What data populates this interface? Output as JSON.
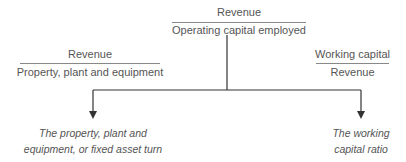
{
  "top_ratio": {
    "numerator": "Revenue",
    "denominator": "Operating capital employed"
  },
  "left_ratio": {
    "numerator": "Revenue",
    "denominator": "Property, plant and equipment",
    "result_label": "The property, plant and equipment, or fixed asset turn"
  },
  "right_ratio": {
    "numerator": "Working capital",
    "denominator": "Revenue",
    "result_label": "The working capital ratio"
  },
  "colors": {
    "text": "#555555",
    "lines": "#333333",
    "rules": "#888888"
  }
}
